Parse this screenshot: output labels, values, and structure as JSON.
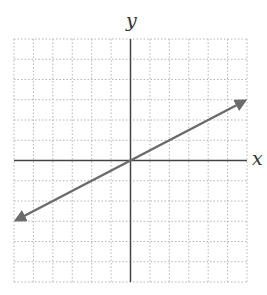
{
  "chart_data": {
    "type": "line",
    "title": "",
    "xlabel": "x",
    "ylabel": "y",
    "xlim": [
      -6,
      6
    ],
    "ylim": [
      -6,
      6
    ],
    "grid": true,
    "grid_style": "dotted",
    "tick_labels": false,
    "series": [
      {
        "name": "line",
        "equation": "y = x/2",
        "x": [
          -5.9,
          5.9
        ],
        "y": [
          -2.95,
          2.95
        ],
        "arrows_both_ends": true,
        "color": "#6b6b6b"
      }
    ]
  },
  "colors": {
    "grid": "#b5b5b5",
    "axes": "#444444",
    "line": "#6b6b6b",
    "background": "#ffffff"
  }
}
